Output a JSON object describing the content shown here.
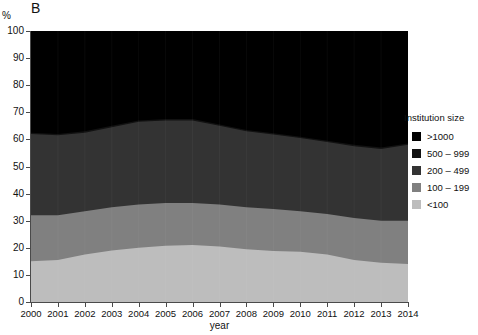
{
  "panel": {
    "letter": "B"
  },
  "axes": {
    "y_unit": "%",
    "x_title": "year",
    "y_ticks": [
      "0",
      "10",
      "20",
      "30",
      "40",
      "50",
      "60",
      "70",
      "80",
      "90",
      "100"
    ],
    "x_ticks": [
      "2000",
      "2001",
      "2002",
      "2003",
      "2004",
      "2005",
      "2006",
      "2007",
      "2008",
      "2009",
      "2010",
      "2011",
      "2012",
      "2013",
      "2014"
    ]
  },
  "legend": {
    "title": "Institution size",
    "items": [
      {
        "label": ">1000",
        "color": "#000000"
      },
      {
        "label": "500 – 999",
        "color": "#121212"
      },
      {
        "label": "200 – 499",
        "color": "#333333"
      },
      {
        "label": "100 – 199",
        "color": "#808080"
      },
      {
        "label": "<100",
        "color": "#bdbdbd"
      }
    ]
  },
  "chart_data": {
    "type": "area",
    "title": "",
    "xlabel": "year",
    "ylabel": "%",
    "ylim": [
      0,
      100
    ],
    "xlim": [
      2000,
      2014
    ],
    "grid": false,
    "stacked": true,
    "stack_order_bottom_to_top": [
      "<100",
      "100 – 199",
      "200 – 499",
      "500 – 999",
      ">1000"
    ],
    "legend_position": "right",
    "x": [
      2000,
      2001,
      2002,
      2003,
      2004,
      2005,
      2006,
      2007,
      2008,
      2009,
      2010,
      2011,
      2012,
      2013,
      2014
    ],
    "series": [
      {
        "name": "<100",
        "color": "#bdbdbd",
        "values": [
          15.0,
          15.5,
          17.5,
          19.0,
          20.0,
          20.8,
          21.0,
          20.5,
          19.5,
          18.8,
          18.5,
          17.5,
          15.5,
          14.5,
          14.0
        ]
      },
      {
        "name": "100 – 199",
        "color": "#808080",
        "values": [
          17.0,
          16.5,
          16.0,
          16.0,
          16.0,
          15.7,
          15.5,
          15.5,
          15.5,
          15.5,
          15.0,
          15.0,
          15.5,
          15.5,
          16.0
        ]
      },
      {
        "name": "200 – 499",
        "color": "#333333",
        "values": [
          30.0,
          29.5,
          29.0,
          29.5,
          30.5,
          30.5,
          30.5,
          29.0,
          28.0,
          27.5,
          27.0,
          26.5,
          26.5,
          26.5,
          28.0
        ]
      },
      {
        "name": "500 – 999",
        "color": "#121212",
        "values": [
          0.5,
          0.5,
          0.5,
          0.5,
          0.5,
          0.5,
          0.5,
          0.5,
          0.5,
          0.5,
          0.5,
          0.5,
          0.5,
          0.5,
          0.5
        ]
      },
      {
        "name": ">1000",
        "color": "#000000",
        "values": [
          37.5,
          38.0,
          37.0,
          35.0,
          33.0,
          32.5,
          32.5,
          34.5,
          36.5,
          37.7,
          39.0,
          40.5,
          42.0,
          43.0,
          41.5
        ]
      }
    ],
    "cumulative_tops": {
      "<100": [
        15.0,
        15.5,
        17.5,
        19.0,
        20.0,
        20.8,
        21.0,
        20.5,
        19.5,
        18.8,
        18.5,
        17.5,
        15.5,
        14.5,
        14.0
      ],
      "100 – 199": [
        32.0,
        32.0,
        33.5,
        35.0,
        36.0,
        36.5,
        36.5,
        36.0,
        35.0,
        34.3,
        33.5,
        32.5,
        31.0,
        30.0,
        30.0
      ],
      "200 – 499": [
        62.0,
        61.5,
        62.5,
        64.5,
        66.5,
        67.0,
        67.0,
        65.0,
        63.0,
        61.8,
        60.5,
        59.0,
        57.5,
        56.5,
        58.0
      ],
      "500 – 999": [
        62.5,
        62.0,
        63.0,
        65.0,
        67.0,
        67.5,
        67.5,
        65.5,
        63.5,
        62.3,
        61.0,
        59.5,
        58.0,
        57.0,
        58.5
      ],
      ">1000": [
        100,
        100,
        100,
        100,
        100,
        100,
        100,
        100,
        100,
        100,
        100,
        100,
        100,
        100,
        100
      ]
    }
  }
}
